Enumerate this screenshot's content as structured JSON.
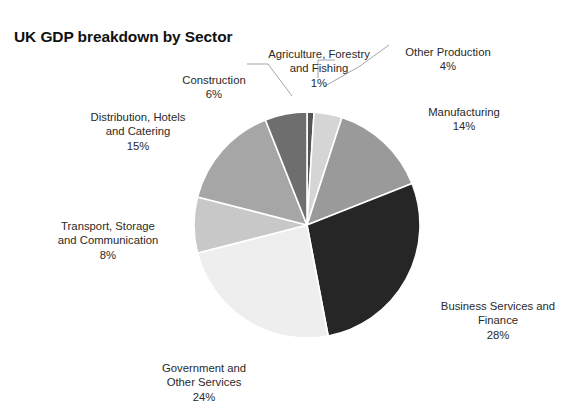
{
  "chart_data": {
    "type": "pie",
    "title": "UK GDP breakdown by Sector",
    "unit": "%",
    "categories": [
      "Agriculture, Forestry and Fishing",
      "Other Production",
      "Manufacturing",
      "Business Services and Finance",
      "Government and Other Services",
      "Transport, Storage and Communication",
      "Distribution, Hotels and Catering",
      "Construction"
    ],
    "values": [
      1,
      4,
      14,
      28,
      24,
      8,
      15,
      6
    ],
    "colors": [
      "#555555",
      "#d5d5d5",
      "#9a9a9a",
      "#262626",
      "#eeeeee",
      "#c8c8c8",
      "#a6a6a6",
      "#6e6e6e"
    ],
    "start_angle_deg": 0,
    "direction": "clockwise",
    "legend": "none",
    "grid": false,
    "slice_border_color": "#ffffff",
    "background": "#ffffff",
    "slices": [
      {
        "name": "Agriculture, Forestry and Fishing",
        "label_line1": "Agriculture, Forestry",
        "label_line2": "and Fishing",
        "percent_label": "1%",
        "value": 1,
        "color": "#555555"
      },
      {
        "name": "Other Production",
        "label_line1": "Other Production",
        "label_line2": "",
        "percent_label": "4%",
        "value": 4,
        "color": "#d5d5d5"
      },
      {
        "name": "Manufacturing",
        "label_line1": "Manufacturing",
        "label_line2": "",
        "percent_label": "14%",
        "value": 14,
        "color": "#9a9a9a"
      },
      {
        "name": "Business Services and Finance",
        "label_line1": "Business Services and",
        "label_line2": "Finance",
        "percent_label": "28%",
        "value": 28,
        "color": "#262626"
      },
      {
        "name": "Government and Other Services",
        "label_line1": "Government and",
        "label_line2": "Other Services",
        "percent_label": "24%",
        "value": 24,
        "color": "#eeeeee"
      },
      {
        "name": "Transport, Storage and Communication",
        "label_line1": "Transport, Storage",
        "label_line2": "and Communication",
        "percent_label": "8%",
        "value": 8,
        "color": "#c8c8c8"
      },
      {
        "name": "Distribution, Hotels and Catering",
        "label_line1": "Distribution, Hotels",
        "label_line2": "and Catering",
        "percent_label": "15%",
        "value": 15,
        "color": "#a6a6a6"
      },
      {
        "name": "Construction",
        "label_line1": "Construction",
        "label_line2": "",
        "percent_label": "6%",
        "value": 6,
        "color": "#6e6e6e"
      }
    ]
  },
  "labels": {
    "agriculture": "Agriculture, Forestry\nand Fishing",
    "agriculture_pct": "1%",
    "other_production": "Other Production",
    "other_production_pct": "4%",
    "manufacturing": "Manufacturing",
    "manufacturing_pct": "14%",
    "business": "Business Services and\nFinance",
    "business_pct": "28%",
    "government": "Government and\nOther Services",
    "government_pct": "24%",
    "transport": "Transport, Storage\nand Communication",
    "transport_pct": "8%",
    "distribution": "Distribution, Hotels\nand Catering",
    "distribution_pct": "15%",
    "construction": "Construction",
    "construction_pct": "6%"
  }
}
